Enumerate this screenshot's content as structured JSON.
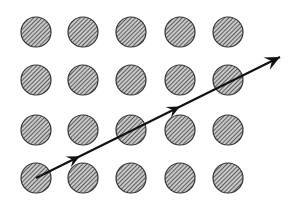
{
  "diagram": {
    "grid": {
      "columns": 5,
      "rows": 4,
      "col_x": [
        36,
        83,
        131,
        180,
        228
      ],
      "row_y": [
        32,
        80,
        130,
        178
      ],
      "radius": 15,
      "fill_pattern": "diagonal-hatch",
      "stroke_color": "#333333",
      "hatch_color": "#3a3a3a",
      "background_color": "#ffffff"
    },
    "arrow": {
      "start": [
        36,
        178
      ],
      "end": [
        280,
        57
      ],
      "color": "#111111",
      "mid_arrowheads_t": [
        0.18,
        0.59
      ],
      "line_width": 2.2
    }
  }
}
